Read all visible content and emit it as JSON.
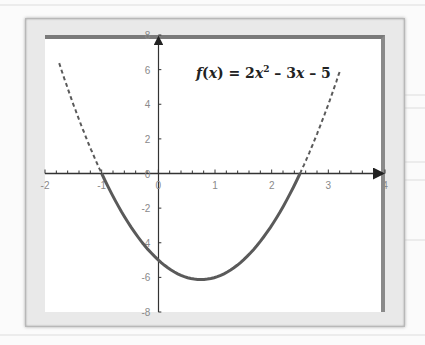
{
  "chart_data": {
    "type": "line",
    "function": "2x^2 - 3x - 5",
    "xlabel": "",
    "ylabel": "",
    "xlim": [
      -2,
      4
    ],
    "ylim": [
      -8,
      8
    ],
    "xticks": [
      -2,
      -1,
      0,
      1,
      2,
      3,
      4
    ],
    "yticks": [
      8,
      6,
      4,
      2,
      0,
      -2,
      -4,
      -6,
      -8
    ],
    "grid": false,
    "legend": null,
    "series": [
      {
        "name": "f(x) dashed left",
        "style": "dashed",
        "x": [
          -1.75,
          -1.5,
          -1.25,
          -1.0
        ],
        "y": [
          6.375,
          4.0,
          1.875,
          0.0
        ]
      },
      {
        "name": "f(x) solid",
        "style": "solid",
        "x": [
          -1.0,
          -0.5,
          0.0,
          0.5,
          0.75,
          1.0,
          1.5,
          2.0,
          2.5
        ],
        "y": [
          0.0,
          -3.0,
          -5.0,
          -6.0,
          -6.125,
          -6.0,
          -5.0,
          -3.0,
          0.0
        ]
      },
      {
        "name": "f(x) dashed right",
        "style": "dashed",
        "x": [
          2.5,
          2.75,
          3.0,
          3.2
        ],
        "y": [
          0.0,
          1.875,
          4.0,
          5.88
        ]
      }
    ],
    "annotations": [
      {
        "text": "f(x) = 2x² − 3x − 5",
        "x": 1.4,
        "y": 6
      }
    ],
    "roots": [
      -1,
      2.5
    ],
    "vertex": [
      0.75,
      -6.125
    ],
    "y_intercept": -5
  },
  "labels": {
    "formula_f": "f",
    "formula_lp": "(",
    "formula_x": "x",
    "formula_rp": ")",
    "formula_eq": " = 2",
    "formula_x2": "x",
    "formula_sup": "2",
    "formula_mid": " – 3",
    "formula_x3": "x",
    "formula_end": " – 5"
  },
  "x_tick_labels": [
    "-2",
    "-1",
    "0",
    "1",
    "2",
    "3",
    "4"
  ],
  "y_tick_labels": [
    "8",
    "6",
    "4",
    "2",
    "0",
    "-2",
    "-4",
    "-6",
    "-8"
  ],
  "colors": {
    "curve": "#5a5a5a",
    "axis": "#333333",
    "frame": "#e9e9e9",
    "tick_label": "#8a8a8a"
  }
}
